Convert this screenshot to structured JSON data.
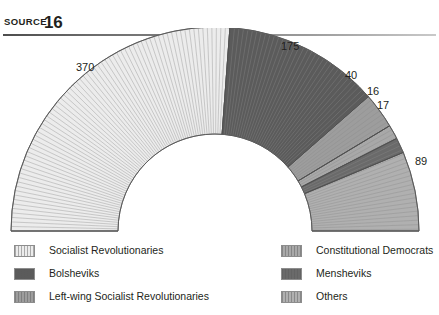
{
  "header": {
    "source_label": "SOURCE",
    "source_number": "16"
  },
  "chart_data": {
    "type": "pie",
    "variant": "semicircle-hemicycle",
    "title": "",
    "subtitle": "",
    "xlabel": "",
    "ylabel": "",
    "total_seats": 707,
    "legend_position": "bottom",
    "grid": false,
    "start_angle_deg": 180,
    "end_angle_deg": 360,
    "categories": [
      "Socialist Revolutionaries",
      "Bolsheviks",
      "Left-wing Socialist Revolutionaries",
      "Constitutional Democrats",
      "Mensheviks",
      "Others"
    ],
    "values": [
      370,
      175,
      40,
      16,
      17,
      89
    ],
    "colors": [
      "#ececec",
      "#5b5b5b",
      "#9d9d9d",
      "#a8a8a8",
      "#6a6a6a",
      "#b0b0b0"
    ],
    "slices": [
      {
        "label": "Socialist Revolutionaries",
        "value": 370,
        "value_text": "370",
        "color": "#ececec"
      },
      {
        "label": "Bolsheviks",
        "value": 175,
        "value_text": "175",
        "color": "#5b5b5b"
      },
      {
        "label": "Left-wing Socialist Revolutionaries",
        "value": 40,
        "value_text": "40",
        "color": "#9d9d9d"
      },
      {
        "label": "Constitutional Democrats",
        "value": 16,
        "value_text": "16",
        "color": "#a8a8a8"
      },
      {
        "label": "Mensheviks",
        "value": 17,
        "value_text": "17",
        "color": "#6a6a6a"
      },
      {
        "label": "Others",
        "value": 89,
        "value_text": "89",
        "color": "#b0b0b0"
      }
    ]
  },
  "value_labels": {
    "sr": "370",
    "bolsheviks": "175",
    "left_sr": "40",
    "kadets": "16",
    "mensheviks": "17",
    "others": "89"
  },
  "legend": {
    "left_column": [
      {
        "label": "Socialist Revolutionaries",
        "color": "#ececec"
      },
      {
        "label": "Bolsheviks",
        "color": "#5b5b5b"
      },
      {
        "label": "Left-wing Socialist Revolutionaries",
        "color": "#9d9d9d"
      }
    ],
    "right_column": [
      {
        "label": "Constitutional Democrats",
        "color": "#a8a8a8"
      },
      {
        "label": "Mensheviks",
        "color": "#6a6a6a"
      },
      {
        "label": "Others",
        "color": "#b0b0b0"
      }
    ]
  }
}
